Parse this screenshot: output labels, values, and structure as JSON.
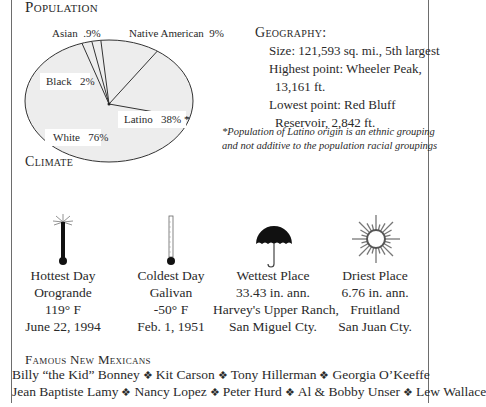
{
  "population": {
    "title": "Population",
    "labels": {
      "asian": "Asian  .9%",
      "native": "Native American  9%",
      "black": "Black   2%",
      "latino": "Latino   38% *",
      "white": "White   76%"
    }
  },
  "chart_data": {
    "type": "pie",
    "title": "Population",
    "slices": [
      {
        "name": "White",
        "value": 76,
        "label": "White 76%"
      },
      {
        "name": "Black",
        "value": 2,
        "label": "Black 2%"
      },
      {
        "name": "Asian",
        "value": 0.9,
        "label": "Asian .9%"
      },
      {
        "name": "Native American",
        "value": 9,
        "label": "Native American 9%"
      },
      {
        "name": "Latino",
        "value": 38,
        "label": "Latino 38% *"
      }
    ],
    "annotation": "*Population of Latino origin is an ethnic grouping and not additive to the population racial groupings",
    "fill_color": "#ededed",
    "stroke_color": "#333333"
  },
  "geography": {
    "title": "Geography:",
    "size": "Size: 121,593 sq. mi., 5th largest",
    "highest_line1": "Highest point:  Wheeler Peak,",
    "highest_line2": "13,161 ft.",
    "lowest_line1": "Lowest point:  Red Bluff",
    "lowest_line2": "Reservoir, 2,842 ft."
  },
  "footnote": {
    "line1": "*Population of Latino origin is an ethnic grouping",
    "line2": "and not additive to the population racial groupings"
  },
  "climate": {
    "title": "Climate",
    "items": [
      {
        "icon": "hot-thermometer-icon",
        "lines": [
          "Hottest Day",
          "Orogrande",
          "119° F",
          "June 22, 1994"
        ]
      },
      {
        "icon": "cold-thermometer-icon",
        "lines": [
          "Coldest Day",
          "Galivan",
          "-50° F",
          "Feb. 1, 1951"
        ]
      },
      {
        "icon": "umbrella-icon",
        "lines": [
          "Wettest Place",
          "33.43 in. ann.",
          "Harvey's Upper Ranch,",
          "San Miguel Cty."
        ]
      },
      {
        "icon": "sun-icon",
        "lines": [
          "Driest Place",
          "6.76 in. ann.",
          "Fruitland",
          "San Juan Cty."
        ]
      }
    ]
  },
  "famous": {
    "title": "Famous New Mexicans",
    "separator": "❖",
    "row1": [
      "Billy “the Kid” Bonney",
      "Kit Carson",
      "Tony Hillerman",
      "Georgia O’Keeffe"
    ],
    "row2": [
      "Jean Baptiste Lamy",
      "Nancy Lopez",
      "Peter Hurd",
      "Al & Bobby Unser",
      "Lew Wallace"
    ]
  }
}
